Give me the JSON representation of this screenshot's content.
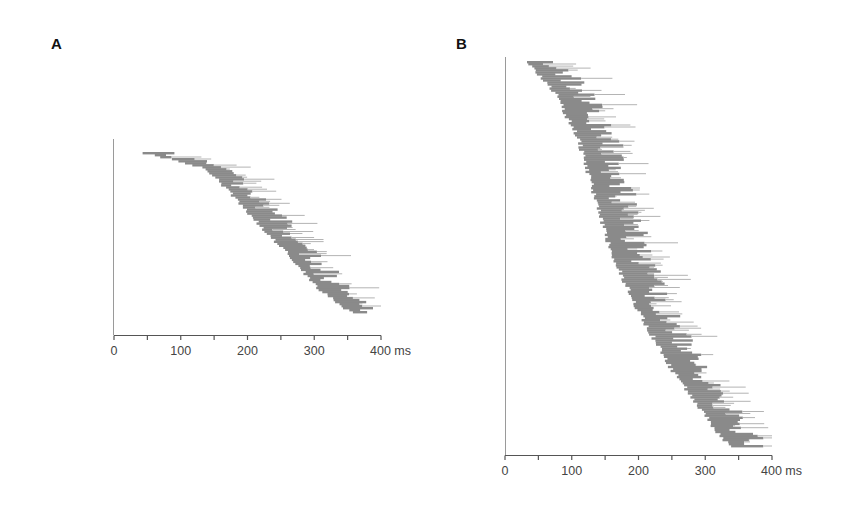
{
  "figure": {
    "panels": [
      {
        "id": "A",
        "label": "A"
      },
      {
        "id": "B",
        "label": "B"
      }
    ],
    "colors": {
      "raster": "#8a8a8a",
      "raster_dark": "#7a7a7a",
      "raster_light": "#b4b4b4",
      "axis": "#555555",
      "background": "#ffffff"
    }
  },
  "chart_data": [
    {
      "type": "raster",
      "panel": "A",
      "title": "",
      "xlabel": "ms",
      "ylabel": "",
      "xlim": [
        0,
        400
      ],
      "x_ticks": [
        0,
        50,
        100,
        150,
        200,
        250,
        300,
        350,
        400
      ],
      "x_tick_labels": [
        "0",
        "100",
        "200",
        "300",
        "400 ms"
      ],
      "x_tick_label_values": [
        0,
        100,
        200,
        300,
        400
      ],
      "grid": false,
      "n_rows": 80,
      "onset_profile_ms": [
        [
          0,
          45
        ],
        [
          0.05,
          95
        ],
        [
          0.1,
          140
        ],
        [
          0.3,
          185
        ],
        [
          0.5,
          230
        ],
        [
          0.7,
          275
        ],
        [
          0.85,
          305
        ],
        [
          1.0,
          355
        ]
      ],
      "offset_spread_ms": [
        15,
        80
      ],
      "offset_cap_ms": 400,
      "seed": 7
    },
    {
      "type": "raster",
      "panel": "B",
      "title": "",
      "xlabel": "ms",
      "ylabel": "",
      "xlim": [
        0,
        400
      ],
      "x_ticks": [
        0,
        50,
        100,
        150,
        200,
        250,
        300,
        350,
        400
      ],
      "x_tick_labels": [
        "0",
        "100",
        "200",
        "300",
        "400 ms"
      ],
      "x_tick_label_values": [
        0,
        100,
        200,
        300,
        400
      ],
      "grid": false,
      "n_rows": 190,
      "onset_profile_ms": [
        [
          0,
          35
        ],
        [
          0.08,
          75
        ],
        [
          0.2,
          110
        ],
        [
          0.35,
          135
        ],
        [
          0.5,
          160
        ],
        [
          0.65,
          200
        ],
        [
          0.8,
          250
        ],
        [
          0.92,
          300
        ],
        [
          1.0,
          335
        ]
      ],
      "offset_spread_ms": [
        20,
        95
      ],
      "offset_cap_ms": 400,
      "seed": 13
    }
  ]
}
